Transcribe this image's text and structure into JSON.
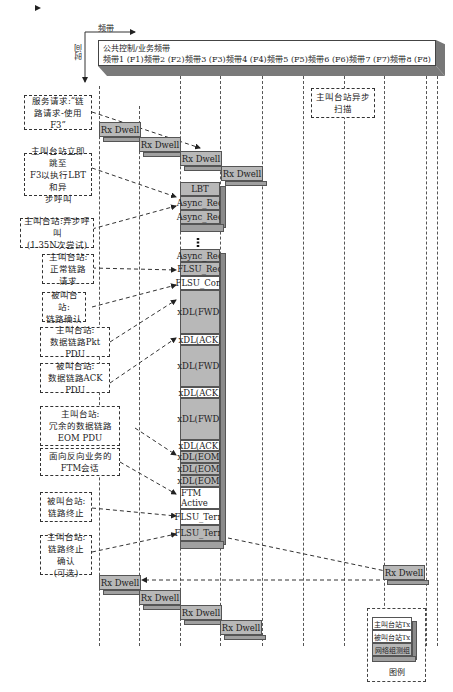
{
  "axes": {
    "x_label": "频带",
    "y_label": "时间"
  },
  "header": {
    "title": "公共控制/业务频带",
    "bands": [
      "频带1 (F1)",
      "频带2 (F2)",
      "频带3 (F3)",
      "频带4 (F4)",
      "频带5 (F5)",
      "频带6 (F6)",
      "频带7 (F7)",
      "频带8 (F8)"
    ]
  },
  "notes": {
    "service_request": "服务请求:“链\n路请求-使用F3”",
    "jump_f3": "主叫台站立即跳至\nF3以执行LBT和异\n步呼叫",
    "async_call": "主叫台站:异步呼叫\n(1.35N次尝试)",
    "normal_link_req": "主叫台站:\n正常链路请求",
    "link_confirm": "被叫台站:\n链路确认",
    "pkt_pdu": "主叫台站:\n数据链路Pkt PDU",
    "ack_pdu": "被叫台站:\n数据链路ACK PDU",
    "eom_pdu": "主叫台站:\n冗余的数据链路\nEOM PDU",
    "ftm_session": "面向反向业务的\nFTM会话",
    "link_term": "被叫台站:\n链路终止",
    "link_term_ack": "主叫台站:\n链路终止确认\n(可选)",
    "async_scan": "主叫台站异步\n扫描"
  },
  "rx_dwell_top": [
    "Rx Dwell",
    "Rx Dwell",
    "Rx Dwell",
    "Rx Dwell"
  ],
  "stack1": [
    "LBT",
    "Async_Req",
    "Async_Req"
  ],
  "stack2": [
    "Async_Req",
    "FLSU_Req",
    "FLSU_Conf",
    "xDL(FWD)",
    "xDL(ACK)",
    "xDL(FWD)",
    "xDL(ACK)",
    "xDL(FWD)",
    "xDL(ACK)",
    "xDL(EOM)",
    "xDL(EOM)",
    "xDL(EOM)",
    "FTM Active",
    "FLSU_Term",
    "FLSU_Term"
  ],
  "rx_dwell_f7": "Rx Dwell",
  "rx_dwell_bottom": [
    "Rx Dwell",
    "Rx Dwell",
    "Rx Dwell",
    "Rx Dwell"
  ],
  "legend": {
    "title": "图例",
    "items": [
      "主叫台站Tx",
      "被叫台站Tx",
      "网络组测组"
    ]
  }
}
